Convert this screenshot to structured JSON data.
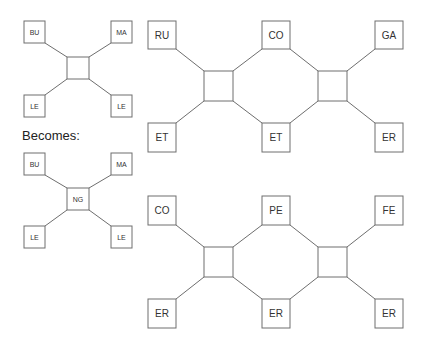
{
  "caption": "Becomes:",
  "small_before": {
    "top_left": "BU",
    "top_right": "MA",
    "bottom_left": "LE",
    "bottom_right": "LE",
    "center": ""
  },
  "small_after": {
    "top_left": "BU",
    "top_right": "MA",
    "bottom_left": "LE",
    "bottom_right": "LE",
    "center": "NG"
  },
  "big_top": {
    "top": [
      "RU",
      "CO",
      "GA"
    ],
    "bottom": [
      "ET",
      "ET",
      "ER"
    ]
  },
  "big_bottom": {
    "top": [
      "CO",
      "PE",
      "FE"
    ],
    "bottom": [
      "ER",
      "ER",
      "ER"
    ]
  }
}
